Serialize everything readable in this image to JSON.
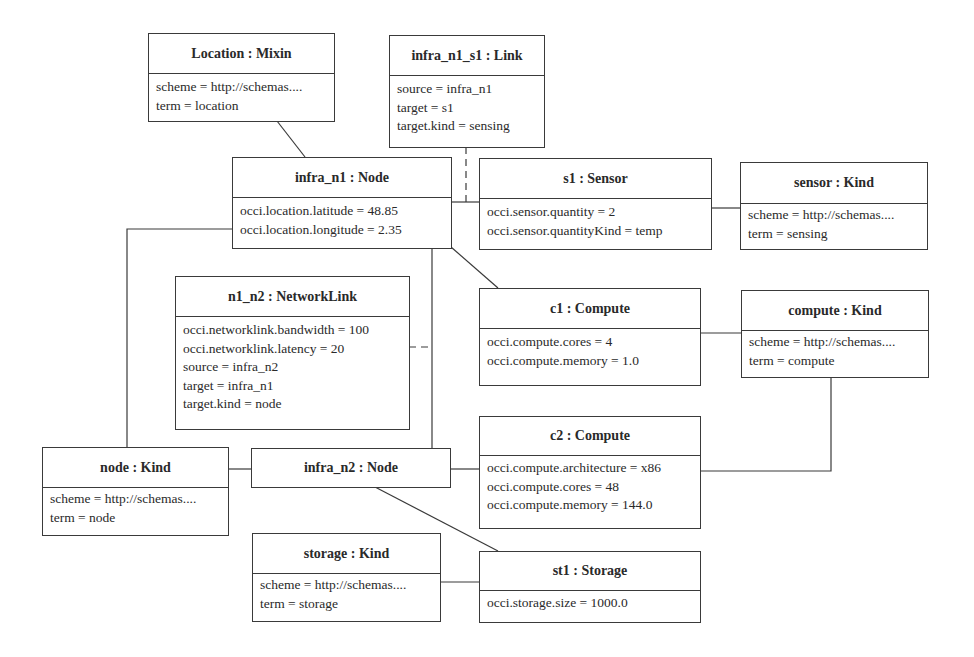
{
  "diagram": {
    "type": "uml-object-diagram",
    "objects": [
      {
        "id": "location_mixin",
        "title": "Location : Mixin",
        "attributes": [
          "scheme = http://schemas....",
          "term = location"
        ]
      },
      {
        "id": "infra_n1_s1",
        "title": "infra_n1_s1 : Link",
        "attributes": [
          "source = infra_n1",
          "target = s1",
          "target.kind = sensing"
        ]
      },
      {
        "id": "infra_n1",
        "title": "infra_n1 : Node",
        "attributes": [
          "occi.location.latitude = 48.85",
          "occi.location.longitude = 2.35"
        ]
      },
      {
        "id": "s1",
        "title": "s1 : Sensor",
        "attributes": [
          "occi.sensor.quantity = 2",
          "occi.sensor.quantityKind = temp"
        ]
      },
      {
        "id": "sensor_kind",
        "title": "sensor : Kind",
        "attributes": [
          "scheme = http://schemas....",
          "term = sensing"
        ]
      },
      {
        "id": "n1_n2",
        "title": "n1_n2 : NetworkLink",
        "attributes": [
          "occi.networklink.bandwidth = 100",
          "occi.networklink.latency = 20",
          "source = infra_n2",
          "target = infra_n1",
          "target.kind = node"
        ]
      },
      {
        "id": "c1",
        "title": "c1 : Compute",
        "attributes": [
          "occi.compute.cores = 4",
          "occi.compute.memory = 1.0"
        ]
      },
      {
        "id": "compute_kind",
        "title": "compute : Kind",
        "attributes": [
          "scheme = http://schemas....",
          "term = compute"
        ]
      },
      {
        "id": "node_kind",
        "title": "node : Kind",
        "attributes": [
          "scheme = http://schemas....",
          "term = node"
        ]
      },
      {
        "id": "infra_n2",
        "title": "infra_n2 : Node",
        "attributes": []
      },
      {
        "id": "c2",
        "title": "c2 : Compute",
        "attributes": [
          "occi.compute.architecture = x86",
          "occi.compute.cores = 48",
          "occi.compute.memory = 144.0"
        ]
      },
      {
        "id": "storage_kind",
        "title": "storage : Kind",
        "attributes": [
          "scheme = http://schemas....",
          "term = storage"
        ]
      },
      {
        "id": "st1",
        "title": "st1 : Storage",
        "attributes": [
          "occi.storage.size = 1000.0"
        ]
      }
    ],
    "links": [
      {
        "from": "location_mixin",
        "to": "infra_n1",
        "style": "solid"
      },
      {
        "from": "infra_n1",
        "to": "s1",
        "style": "solid"
      },
      {
        "from": "infra_n1_s1",
        "to": "infra_n1-s1 association",
        "style": "dashed"
      },
      {
        "from": "s1",
        "to": "sensor_kind",
        "style": "solid"
      },
      {
        "from": "infra_n1",
        "to": "c1",
        "style": "solid"
      },
      {
        "from": "c1",
        "to": "compute_kind",
        "style": "solid"
      },
      {
        "from": "infra_n1",
        "to": "node_kind",
        "style": "solid"
      },
      {
        "from": "infra_n1",
        "to": "infra_n2",
        "style": "solid"
      },
      {
        "from": "n1_n2",
        "to": "infra_n1-infra_n2 association",
        "style": "dashed"
      },
      {
        "from": "node_kind",
        "to": "infra_n2",
        "style": "solid"
      },
      {
        "from": "infra_n2",
        "to": "c2",
        "style": "solid"
      },
      {
        "from": "c2",
        "to": "compute_kind",
        "style": "solid"
      },
      {
        "from": "infra_n2",
        "to": "st1",
        "style": "solid"
      },
      {
        "from": "storage_kind",
        "to": "st1",
        "style": "solid"
      }
    ],
    "colors": {
      "line": "#3a3a3a",
      "background": "#ffffff",
      "text": "#2a2a2a"
    }
  }
}
